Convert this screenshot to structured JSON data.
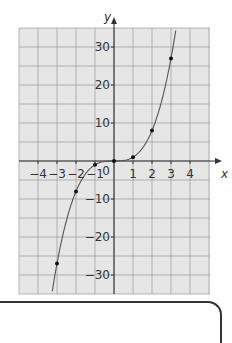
{
  "chart_data": {
    "type": "line",
    "title": "",
    "function": "y = x^3",
    "xlabel": "x",
    "ylabel": "y",
    "xlim": [
      -4.5,
      5.2
    ],
    "ylim": [
      -35,
      35
    ],
    "grid": true,
    "x_ticks": [
      -4,
      -3,
      -2,
      -1,
      1,
      2,
      3,
      4
    ],
    "x_tick_labels": [
      "-4",
      "-3",
      "-2",
      "-1",
      "1",
      "2",
      "3",
      "4"
    ],
    "origin_label": "0",
    "y_ticks": [
      30,
      20,
      10,
      -10,
      -20,
      -30
    ],
    "y_tick_labels": [
      "30",
      "20",
      "10",
      "-10",
      "-20",
      "-30"
    ],
    "points": {
      "x": [
        -3,
        -2,
        -1,
        0,
        1,
        2,
        3
      ],
      "y": [
        -27,
        -8,
        -1,
        0,
        1,
        8,
        27
      ]
    },
    "colors": {
      "grid_bg": "#e6e6e6",
      "grid_line": "#9a9a9a",
      "axis": "#333333",
      "curve": "#555555",
      "point": "#111111"
    }
  }
}
